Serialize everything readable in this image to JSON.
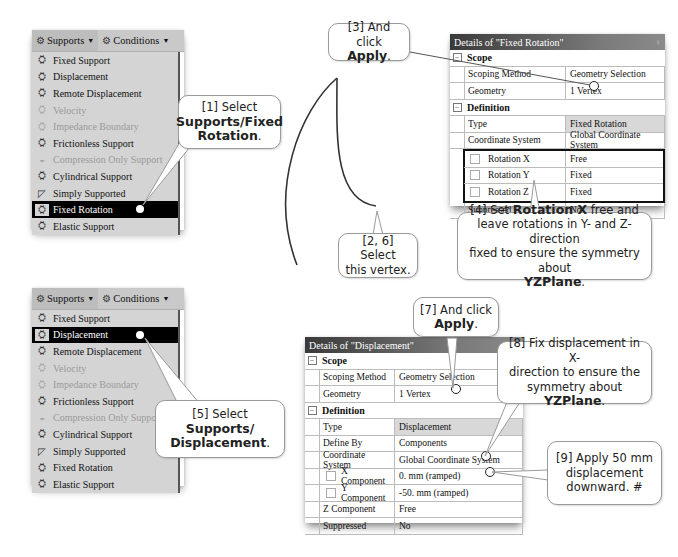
{
  "menu_top": {
    "menubar": [
      {
        "label": "Supports",
        "icon": "supports-icon"
      },
      {
        "label": "Conditions",
        "icon": "conditions-icon"
      }
    ],
    "items": [
      {
        "label": "Fixed Support",
        "state": "normal"
      },
      {
        "label": "Displacement",
        "state": "normal"
      },
      {
        "label": "Remote Displacement",
        "state": "normal"
      },
      {
        "label": "Velocity",
        "state": "disabled"
      },
      {
        "label": "Impedance Boundary",
        "state": "disabled"
      },
      {
        "label": "Frictionless Support",
        "state": "normal"
      },
      {
        "label": "Compression Only Support",
        "state": "disabled"
      },
      {
        "label": "Cylindrical Support",
        "state": "normal"
      },
      {
        "label": "Simply Supported",
        "state": "normal"
      },
      {
        "label": "Fixed Rotation",
        "state": "selected"
      },
      {
        "label": "Elastic Support",
        "state": "normal"
      }
    ]
  },
  "menu_bottom": {
    "menubar": [
      {
        "label": "Supports",
        "icon": "supports-icon"
      },
      {
        "label": "Conditions",
        "icon": "conditions-icon"
      }
    ],
    "items": [
      {
        "label": "Fixed Support",
        "state": "normal"
      },
      {
        "label": "Displacement",
        "state": "selected"
      },
      {
        "label": "Remote Displacement",
        "state": "normal"
      },
      {
        "label": "Velocity",
        "state": "disabled"
      },
      {
        "label": "Impedance Boundary",
        "state": "disabled"
      },
      {
        "label": "Frictionless Support",
        "state": "normal"
      },
      {
        "label": "Compression Only Support",
        "state": "disabled"
      },
      {
        "label": "Cylindrical Support",
        "state": "normal"
      },
      {
        "label": "Simply Supported",
        "state": "normal"
      },
      {
        "label": "Fixed Rotation",
        "state": "normal"
      },
      {
        "label": "Elastic Support",
        "state": "normal"
      }
    ]
  },
  "details_fixed_rotation": {
    "title": "Details of \"Fixed Rotation\"",
    "pin": "♀",
    "groups": {
      "scope": "Scope",
      "definition": "Definition"
    },
    "rows": {
      "scoping_method": {
        "k": "Scoping Method",
        "v": "Geometry Selection"
      },
      "geometry": {
        "k": "Geometry",
        "v": "1 Vertex"
      },
      "type": {
        "k": "Type",
        "v": "Fixed Rotation"
      },
      "coord": {
        "k": "Coordinate System",
        "v": "Global Coordinate System"
      },
      "rot_x": {
        "k": "Rotation X",
        "v": "Free"
      },
      "rot_y": {
        "k": "Rotation Y",
        "v": "Fixed"
      },
      "rot_z": {
        "k": "Rotation Z",
        "v": "Fixed"
      },
      "suppressed": {
        "k": "Suppressed",
        "v": "No"
      }
    }
  },
  "details_displacement": {
    "title": "Details of \"Displacement\"",
    "groups": {
      "scope": "Scope",
      "definition": "Definition"
    },
    "rows": {
      "scoping_method": {
        "k": "Scoping Method",
        "v": "Geometry Selection"
      },
      "geometry": {
        "k": "Geometry",
        "v": "1 Vertex"
      },
      "type": {
        "k": "Type",
        "v": "Displacement"
      },
      "define_by": {
        "k": "Define By",
        "v": "Components"
      },
      "coord": {
        "k": "Coordinate System",
        "v": "Global Coordinate System"
      },
      "x_comp": {
        "k": "X Component",
        "v": "0. mm  (ramped)"
      },
      "y_comp": {
        "k": "Y Component",
        "v": "-50. mm  (ramped)"
      },
      "z_comp": {
        "k": "Z Component",
        "v": "Free"
      },
      "suppressed": {
        "k": "Suppressed",
        "v": "No"
      }
    }
  },
  "callouts": {
    "c1": {
      "pre": "[1] Select",
      "bold1": "Supports/Fixed",
      "bold2": "Rotation",
      "post": "."
    },
    "c3": {
      "pre": "[3] And click",
      "bold": "Apply",
      "post": "."
    },
    "c26": {
      "line1": "[2, 6] Select",
      "line2": "this vertex."
    },
    "c4": {
      "pre": "[4] Set ",
      "bold": "Rotation X",
      "mid": " free and",
      "line2": "leave rotations in Y- and Z-direction",
      "line3": "fixed to ensure the symmetry about",
      "bold2": "YZPlane",
      "post": "."
    },
    "c5": {
      "pre": "[5] Select ",
      "bold1": "Supports/",
      "bold2": "Displacement",
      "post": "."
    },
    "c7": {
      "pre": "[7] And click",
      "bold": "Apply",
      "post": "."
    },
    "c8": {
      "line1": "[8] Fix displacement in X-",
      "line2": "direction to ensure the",
      "pre3": "symmetry about ",
      "bold": "YZPlane",
      "post": "."
    },
    "c9": {
      "line1": "[9] Apply 50 mm",
      "line2": "displacement",
      "line3": "downward. #"
    }
  }
}
